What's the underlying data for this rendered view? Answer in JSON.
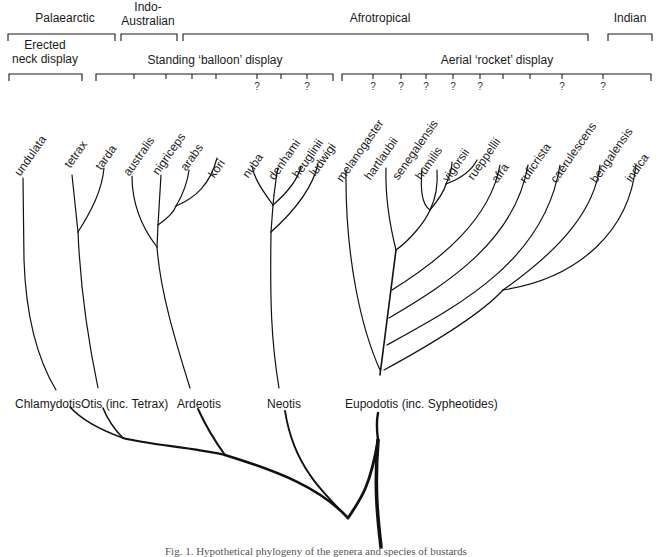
{
  "regions": [
    {
      "label": "Palaearctic",
      "x1": 8,
      "x2": 115,
      "label_x": 65,
      "label_y": 11
    },
    {
      "label_lines": [
        "Indo-",
        "Australian"
      ],
      "x1": 121,
      "x2": 177,
      "label_x": 148,
      "label_y": 0
    },
    {
      "label": "Afrotropical",
      "x1": 183,
      "x2": 588,
      "label_x": 380,
      "label_y": 11
    },
    {
      "label": "Indian",
      "x1": 608,
      "x2": 652,
      "label_x": 630,
      "label_y": 11
    }
  ],
  "displays": [
    {
      "label_lines": [
        "Erected",
        "neck display"
      ],
      "x1": 9,
      "x2": 82,
      "label_x": 45,
      "label_y": 38,
      "ticks": []
    },
    {
      "label": "Standing ‘balloon’ display",
      "x1": 96,
      "x2": 333,
      "label_x": 215,
      "label_y": 53,
      "ticks": [
        {
          "x": 134,
          "q": false
        },
        {
          "x": 166,
          "q": false
        },
        {
          "x": 192,
          "q": false
        },
        {
          "x": 216,
          "q": false
        },
        {
          "x": 257,
          "q": true
        },
        {
          "x": 281,
          "q": false
        },
        {
          "x": 307,
          "q": true
        }
      ]
    },
    {
      "label": "Aerial ‘rocket’ display",
      "x1": 342,
      "x2": 651,
      "label_x": 497,
      "label_y": 53,
      "ticks": [
        {
          "x": 373,
          "q": true
        },
        {
          "x": 401,
          "q": true
        },
        {
          "x": 426,
          "q": true
        },
        {
          "x": 453,
          "q": true
        },
        {
          "x": 480,
          "q": true
        },
        {
          "x": 503,
          "q": false
        },
        {
          "x": 530,
          "q": false
        },
        {
          "x": 562,
          "q": true
        },
        {
          "x": 603,
          "q": true
        }
      ]
    }
  ],
  "question_mark": "?",
  "species": [
    {
      "name": "undulata",
      "x": 22,
      "y": 96
    },
    {
      "name": "tetrax",
      "x": 72,
      "y": 88
    },
    {
      "name": "tarda",
      "x": 103,
      "y": 90
    },
    {
      "name": "australis",
      "x": 131,
      "y": 96
    },
    {
      "name": "nigriceps",
      "x": 160,
      "y": 95
    },
    {
      "name": "arabs",
      "x": 188,
      "y": 91
    },
    {
      "name": "kori",
      "x": 216,
      "y": 98
    },
    {
      "name": "nuba",
      "x": 250,
      "y": 98
    },
    {
      "name": "denhami",
      "x": 276,
      "y": 100
    },
    {
      "name": "heuglinii",
      "x": 300,
      "y": 98
    },
    {
      "name": "ludwigi",
      "x": 317,
      "y": 96
    },
    {
      "name": "melanogaster",
      "x": 344,
      "y": 102
    },
    {
      "name": "hartlaubii",
      "x": 372,
      "y": 100
    },
    {
      "name": "senegalensis",
      "x": 400,
      "y": 100
    },
    {
      "name": "humilis",
      "x": 423,
      "y": 100
    },
    {
      "name": "vigorsii",
      "x": 450,
      "y": 102
    },
    {
      "name": "rueppellii",
      "x": 475,
      "y": 100
    },
    {
      "name": "afra",
      "x": 499,
      "y": 103
    },
    {
      "name": "ruficrista",
      "x": 527,
      "y": 103
    },
    {
      "name": "caerulescens",
      "x": 558,
      "y": 103
    },
    {
      "name": "bengalensis",
      "x": 598,
      "y": 103
    },
    {
      "name": "indica",
      "x": 633,
      "y": 102
    }
  ],
  "genera": [
    {
      "name": "Chlamydotis",
      "x": 15,
      "y": 397
    },
    {
      "name": "Otis (inc. Tetrax)",
      "x": 81,
      "y": 397
    },
    {
      "name": "Ardeotis",
      "x": 177,
      "y": 397
    },
    {
      "name": "Neotis",
      "x": 267,
      "y": 397
    },
    {
      "name": "Eupodotis (inc. Sypheotides)",
      "x": 345,
      "y": 397
    }
  ],
  "caption": "Fig. 1. Hypothetical phylogeny of the genera and species of bustards",
  "colors": {
    "ink": "#1a1a1a",
    "background": "#ffffff"
  }
}
